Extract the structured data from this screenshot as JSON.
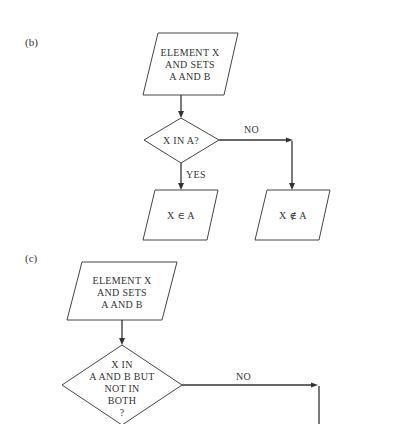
{
  "diagram": {
    "panel_b": {
      "label": "(b)",
      "input_box": {
        "lines": [
          "ELEMENT X",
          "AND SETS",
          "A AND B"
        ]
      },
      "decision": {
        "lines": [
          "X IN A?"
        ]
      },
      "yes_label": "YES",
      "no_label": "NO",
      "yes_output": {
        "text": "X ∈ A"
      },
      "no_output": {
        "text": "X ∉ A"
      }
    },
    "panel_c": {
      "label": "(c)",
      "input_box": {
        "lines": [
          "ELEMENT X",
          "AND SETS",
          "A AND B"
        ]
      },
      "decision": {
        "lines": [
          "X IN",
          "A AND B BUT",
          "NOT IN",
          "BOTH",
          "?"
        ]
      },
      "no_label": "NO"
    },
    "colors": {
      "stroke": "#333333",
      "background": "#ffffff"
    }
  }
}
